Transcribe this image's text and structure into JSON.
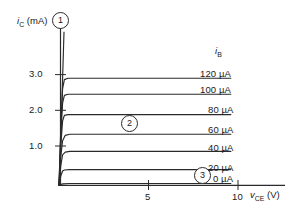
{
  "figure": {
    "background_color": "#ffffff",
    "line_color": "#2a2a2a",
    "text_color": "#1a1a1a"
  },
  "axes": {
    "y_axis_label": "i",
    "y_axis_label_sub": "C",
    "y_axis_units": " (mA)",
    "x_axis_label": "v",
    "x_axis_label_sub": "CE",
    "x_axis_units": " (V)",
    "y_ticks": [
      "1.0",
      "2.0",
      "3.0"
    ],
    "x_ticks": [
      "5",
      "10"
    ]
  },
  "legend": {
    "header": "i",
    "header_sub": "B",
    "labels": [
      "120 µA",
      "100 µA",
      "80 µA",
      "60 µA",
      "40 µA",
      "20 µA",
      "0 µA"
    ]
  },
  "callouts": [
    {
      "label": "1"
    },
    {
      "label": "2"
    },
    {
      "label": "3"
    }
  ],
  "chart_data": {
    "type": "line",
    "title": "",
    "subtitle": "",
    "xlabel": "vCE (V)",
    "ylabel": "iC (mA)",
    "xlim": [
      0,
      11.5
    ],
    "ylim": [
      0,
      4.4
    ],
    "x_ticks": [
      5,
      10
    ],
    "y_ticks": [
      1.0,
      2.0,
      3.0
    ],
    "grid": false,
    "legend_position": "right",
    "legend_title": "iB",
    "annotations": [
      {
        "label": "1",
        "note": "saturation / steep rise region near vCE = 0",
        "x": 0.1,
        "y": 4.3
      },
      {
        "label": "2",
        "note": "active region, flat characteristic curves",
        "x": 4.0,
        "y": 1.78
      },
      {
        "label": "3",
        "note": "cutoff region, iB = 0",
        "x": 8.2,
        "y": 0.3
      }
    ],
    "series": [
      {
        "name": "120 µA",
        "saturation_value": 3.0,
        "knee_x": 0.25,
        "x": [
          0,
          0.1,
          0.2,
          0.3,
          0.5,
          1.0,
          2.0,
          4.0,
          6.0,
          8.0,
          9.6
        ],
        "y": [
          0,
          1.6,
          2.7,
          2.96,
          3.0,
          3.0,
          3.0,
          3.0,
          3.0,
          3.0,
          3.0
        ]
      },
      {
        "name": "100 µA",
        "saturation_value": 2.55,
        "knee_x": 0.25,
        "x": [
          0,
          0.1,
          0.2,
          0.3,
          0.5,
          1.0,
          2.0,
          4.0,
          6.0,
          8.0,
          9.6
        ],
        "y": [
          0,
          1.4,
          2.3,
          2.52,
          2.55,
          2.55,
          2.55,
          2.55,
          2.55,
          2.55,
          2.55
        ]
      },
      {
        "name": "80 µA",
        "saturation_value": 1.98,
        "knee_x": 0.25,
        "x": [
          0,
          0.1,
          0.2,
          0.3,
          0.5,
          1.0,
          2.0,
          4.0,
          6.0,
          8.0,
          9.6
        ],
        "y": [
          0,
          1.1,
          1.8,
          1.96,
          1.98,
          1.98,
          1.98,
          1.98,
          1.98,
          1.98,
          1.98
        ]
      },
      {
        "name": "60 µA",
        "saturation_value": 1.43,
        "knee_x": 0.35,
        "x": [
          0,
          0.1,
          0.2,
          0.35,
          0.6,
          1.0,
          2.0,
          4.0,
          6.0,
          8.0,
          9.6
        ],
        "y": [
          0,
          0.8,
          1.25,
          1.4,
          1.43,
          1.43,
          1.43,
          1.43,
          1.43,
          1.43,
          1.43
        ]
      },
      {
        "name": "40 µA",
        "saturation_value": 0.95,
        "knee_x": 0.35,
        "x": [
          0,
          0.1,
          0.2,
          0.35,
          0.6,
          1.0,
          2.0,
          4.0,
          6.0,
          8.0,
          9.6
        ],
        "y": [
          0,
          0.55,
          0.85,
          0.93,
          0.95,
          0.95,
          0.95,
          0.95,
          0.95,
          0.95,
          0.95
        ]
      },
      {
        "name": "20 µA",
        "saturation_value": 0.44,
        "knee_x": 0.3,
        "x": [
          0,
          0.1,
          0.2,
          0.3,
          0.6,
          1.0,
          2.0,
          4.0,
          6.0,
          8.0,
          9.6
        ],
        "y": [
          0,
          0.26,
          0.4,
          0.43,
          0.44,
          0.44,
          0.44,
          0.44,
          0.44,
          0.44,
          0.44
        ]
      },
      {
        "name": "0 µA",
        "saturation_value": 0.05,
        "knee_x": 0.2,
        "x": [
          0,
          0.2,
          0.6,
          1.0,
          2.0,
          4.0,
          6.0,
          8.0,
          9.6
        ],
        "y": [
          0,
          0.04,
          0.05,
          0.05,
          0.05,
          0.05,
          0.05,
          0.05,
          0.05
        ]
      }
    ],
    "steep_rise_line": {
      "note": "near-vertical saturation boundary at low vCE",
      "x": [
        0.02,
        0.28
      ],
      "y": [
        0.0,
        4.3
      ]
    }
  }
}
